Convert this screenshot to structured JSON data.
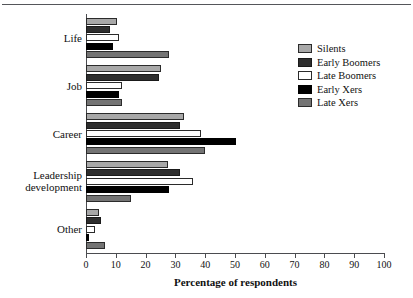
{
  "chart_data": {
    "type": "bar",
    "orientation": "horizontal",
    "title": "",
    "xlabel": "Percentage of respondents",
    "ylabel": "",
    "xlim": [
      0,
      100
    ],
    "xticks": [
      0,
      10,
      20,
      30,
      40,
      50,
      60,
      70,
      80,
      90,
      100
    ],
    "grid": false,
    "legend_position": "right",
    "categories": [
      "Life",
      "Job",
      "Career",
      "Leadership development",
      "Other"
    ],
    "series": [
      {
        "name": "Silents",
        "color": "#a8a8a8",
        "values": [
          10.5,
          25.0,
          33.0,
          27.5,
          4.5
        ]
      },
      {
        "name": "Early Boomers",
        "color": "#2e2e2e",
        "values": [
          8.0,
          24.5,
          31.5,
          31.5,
          5.0
        ]
      },
      {
        "name": "Late Boomers",
        "color": "#ffffff",
        "values": [
          11.0,
          12.0,
          38.5,
          36.0,
          3.0
        ]
      },
      {
        "name": "Early Xers",
        "color": "#000000",
        "values": [
          9.0,
          11.0,
          50.5,
          28.0,
          1.0
        ]
      },
      {
        "name": "Late Xers",
        "color": "#747474",
        "values": [
          28.0,
          12.0,
          40.0,
          15.0,
          6.5
        ]
      }
    ]
  },
  "legend": {
    "items": [
      {
        "label": "Silents"
      },
      {
        "label": "Early Boomers"
      },
      {
        "label": "Late Boomers"
      },
      {
        "label": "Early Xers"
      },
      {
        "label": "Late Xers"
      }
    ]
  },
  "axis": {
    "xlabel": "Percentage of respondents",
    "tick_labels": [
      "0",
      "10",
      "20",
      "30",
      "40",
      "50",
      "60",
      "70",
      "80",
      "90",
      "100"
    ]
  }
}
